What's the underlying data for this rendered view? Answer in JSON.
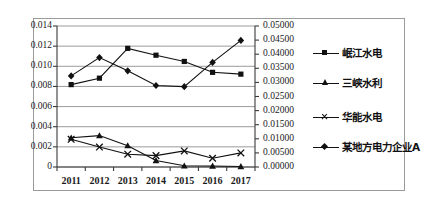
{
  "chart_data": {
    "type": "line",
    "title": "",
    "xlabel": "",
    "ylabel": "",
    "grid": true,
    "legend_position": "right",
    "categories": [
      "2011",
      "2012",
      "2013",
      "2014",
      "2015",
      "2016",
      "2017"
    ],
    "left_axis": {
      "ticks": [
        "0",
        "0.002",
        "0.004",
        "0.006",
        "0.008",
        "0.010",
        "0.012",
        "0.014"
      ],
      "min": 0,
      "max": 0.014,
      "step": 0.002
    },
    "right_axis": {
      "ticks": [
        "0.00000",
        "0.00500",
        "0.01000",
        "0.01500",
        "0.02000",
        "0.02500",
        "0.03000",
        "0.03500",
        "0.04000",
        "0.04500",
        "0.05000"
      ],
      "min": 0,
      "max": 0.05,
      "step": 0.005
    },
    "series": [
      {
        "name": "岷江水电",
        "marker": "square",
        "axis": "left",
        "values": [
          0.00818,
          0.00882,
          0.01178,
          0.0111,
          0.01048,
          0.0094,
          0.00922
        ]
      },
      {
        "name": "三峡水利",
        "marker": "triangle",
        "axis": "left",
        "values": [
          0.0029,
          0.00312,
          0.00212,
          0.00065,
          0.00012,
          0.0001,
          5e-05
        ]
      },
      {
        "name": "华能水电",
        "marker": "x",
        "axis": "left",
        "values": [
          0.00275,
          0.00198,
          0.00127,
          0.00113,
          0.0016,
          0.00087,
          0.0014
        ]
      },
      {
        "name": "某地方电力企业A",
        "marker": "diamond",
        "axis": "right",
        "values": [
          0.0323,
          0.0388,
          0.0341,
          0.0289,
          0.0285,
          0.0371,
          0.0449
        ]
      }
    ]
  },
  "legend": {
    "items": [
      {
        "label": "岷江水电",
        "marker": "square"
      },
      {
        "label": "三峡水利",
        "marker": "triangle"
      },
      {
        "label": "华能水电",
        "marker": "x"
      },
      {
        "label": "某地方电力企业A",
        "marker": "diamond"
      }
    ]
  }
}
